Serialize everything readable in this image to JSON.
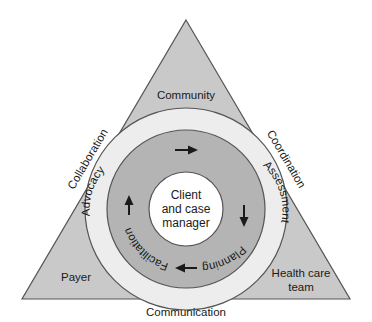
{
  "diagram": {
    "type": "concentric-circles-in-triangle",
    "colors": {
      "triangle_fill": "#c9c9c9",
      "outer_ring_fill": "#ededed",
      "phase_ring_fill": "#b4b4b4",
      "core_fill": "#ffffff",
      "stroke": "#555555",
      "text": "#1a1a1a",
      "page_background": "#ffffff"
    },
    "triangle": {
      "apex_label": "Community",
      "left_corner_label": "Payer",
      "right_corner_label_line1": "Health care",
      "right_corner_label_line2": "team",
      "left_edge_label": "Collaboration",
      "right_edge_label": "Coordination",
      "base_label": "Communication"
    },
    "core": {
      "line1": "Client",
      "line2": "and case",
      "line3": "manager"
    },
    "phases": [
      {
        "label": "Advocacy",
        "position": "upper-left"
      },
      {
        "label": "Assessment",
        "position": "upper-right"
      },
      {
        "label": "Planning",
        "position": "lower-right"
      },
      {
        "label": "Facilitation",
        "position": "lower-left"
      }
    ],
    "arrows": [
      {
        "name": "advocacy-to-assessment",
        "direction": "right",
        "position": "top"
      },
      {
        "name": "assessment-to-planning",
        "direction": "down",
        "position": "right"
      },
      {
        "name": "planning-to-facilitation",
        "direction": "left",
        "position": "bottom"
      },
      {
        "name": "facilitation-to-advocacy",
        "direction": "up",
        "position": "left"
      }
    ]
  }
}
